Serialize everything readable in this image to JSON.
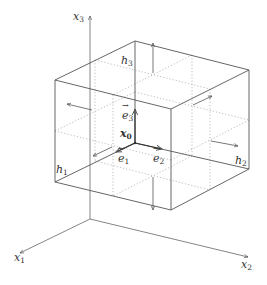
{
  "diagram": {
    "title": "",
    "colors": {
      "edge": "#555555",
      "dotted": "#9a9a9a",
      "axis": "#666666",
      "arrow": "#555555",
      "text": "#333333"
    },
    "axes": {
      "x1": {
        "label": "x",
        "sub": "1"
      },
      "x2": {
        "label": "x",
        "sub": "2"
      },
      "x3": {
        "label": "x",
        "sub": "3"
      }
    },
    "point": {
      "label": "x",
      "sub": "0"
    },
    "basis_vectors": [
      {
        "label": "e",
        "sub": "1"
      },
      {
        "label": "e",
        "sub": "2"
      },
      {
        "label": "e",
        "sub": "3"
      }
    ],
    "half_widths": [
      {
        "label": "h",
        "sub": "1"
      },
      {
        "label": "h",
        "sub": "2"
      },
      {
        "label": "h",
        "sub": "3"
      }
    ]
  }
}
